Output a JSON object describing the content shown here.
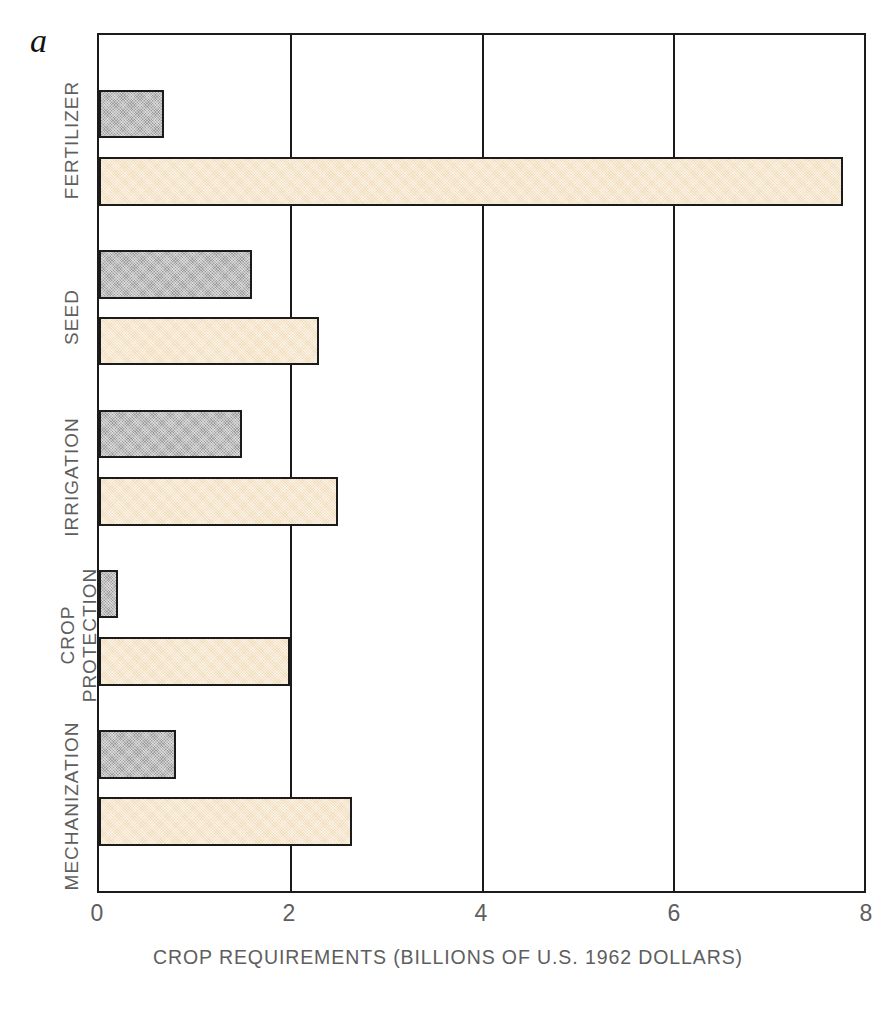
{
  "figure": {
    "panel_letter": "a"
  },
  "chart_data": {
    "type": "bar",
    "orientation": "horizontal",
    "title": "",
    "xlabel": "CROP REQUIREMENTS (BILLIONS OF U.S. 1962 DOLLARS)",
    "ylabel": "",
    "xlim": [
      0,
      8
    ],
    "xticks": [
      0,
      2,
      4,
      6,
      8
    ],
    "xtick_labels": [
      "0",
      "2",
      "4",
      "6",
      "8"
    ],
    "grid": "vertical-only",
    "legend": "none",
    "categories": [
      "FERTILIZER",
      "SEED",
      "IRRIGATION",
      "CROP\nPROTECTION",
      "MECHANIZATION"
    ],
    "series": [
      {
        "name": "gray-series",
        "color": "#9d9d9d",
        "values": [
          0.68,
          1.6,
          1.5,
          0.2,
          0.8
        ]
      },
      {
        "name": "tan-series",
        "color": "#f1ddbb",
        "values": [
          7.78,
          2.3,
          2.5,
          2.0,
          2.65
        ]
      }
    ]
  },
  "axis": {
    "tick_0": "0",
    "tick_2": "2",
    "tick_4": "4",
    "tick_6": "6",
    "tick_8": "8",
    "title": "CROP REQUIREMENTS (BILLIONS OF U.S. 1962 DOLLARS)"
  },
  "categories": {
    "fertilizer": "FERTILIZER",
    "seed": "SEED",
    "irrigation": "IRRIGATION",
    "crop_protection_line1": "CROP",
    "crop_protection_line2": "PROTECTION",
    "mechanization": "MECHANIZATION"
  }
}
